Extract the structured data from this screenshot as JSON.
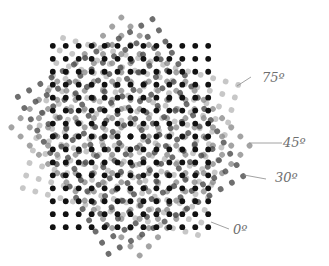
{
  "diagram": {
    "center": {
      "x": 130.5,
      "y": 136.5
    },
    "spacing": 12.95,
    "dot_radius": 2.9,
    "grid": {
      "cols": 13,
      "rows": 15
    },
    "screens": [
      {
        "id": "screen-75",
        "angle": 75,
        "color": "#b4b4b4",
        "opacity": 0.75,
        "label": "75º"
      },
      {
        "id": "screen-45",
        "angle": 45,
        "color": "#8c8c8c",
        "opacity": 0.8,
        "label": "45º"
      },
      {
        "id": "screen-30",
        "angle": 30,
        "color": "#4a4a4a",
        "opacity": 0.8,
        "label": "30º"
      },
      {
        "id": "screen-0",
        "angle": 0,
        "color": "#111111",
        "opacity": 1.0,
        "label": "0º"
      }
    ],
    "labels": [
      {
        "screen": "screen-75",
        "text": "75º",
        "x": 262,
        "y": 82,
        "line": [
          237,
          86,
          251,
          77
        ]
      },
      {
        "screen": "screen-45",
        "text": "45º",
        "x": 283,
        "y": 147,
        "line": [
          249,
          143,
          282,
          143
        ]
      },
      {
        "screen": "screen-30",
        "text": "30º",
        "x": 275,
        "y": 182,
        "line": [
          244,
          175,
          266,
          179
        ]
      },
      {
        "screen": "screen-0",
        "text": "0º",
        "x": 233,
        "y": 234,
        "line": [
          211,
          222,
          229,
          229
        ]
      }
    ]
  }
}
